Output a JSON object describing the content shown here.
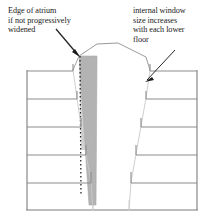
{
  "figure": {
    "type": "architectural-section",
    "background_color": "#ffffff"
  },
  "annotations": {
    "left": {
      "name": "edge-of-atrium-note",
      "text": "Edge of atrium\nif not progressively\nwidened",
      "lines": [
        "Edge of atrium",
        "if not progressively",
        "widened"
      ]
    },
    "right": {
      "name": "internal-window-note",
      "text": "internal window\nsize increases\nwith each lower\nfloor",
      "lines": [
        "internal window",
        "size increases",
        "with each lower",
        "floor"
      ]
    }
  },
  "colors": {
    "wedge_fill": "#b3b3b3",
    "wedge_stroke": "#9a9a9a",
    "line": "#8c8c8c",
    "outline": "#7d7d7d",
    "dotted": "#1f1f1f",
    "leader": "#262626",
    "text": "#1a1a1a"
  },
  "geometry": {
    "left_wall_x": 27,
    "right_wall_x": 197,
    "baseline_y": 210,
    "floor_count": 5,
    "floor_ys": [
      71,
      99,
      127,
      155,
      183
    ],
    "left_opening_x": [
      73,
      77,
      81,
      86,
      91
    ],
    "right_opening_x": [
      150,
      146,
      141,
      136,
      131
    ],
    "atrium_left_top_x": 78,
    "atrium_left_bottom_x": 96,
    "atrium_right_top_x": 145,
    "atrium_right_bottom_x": 127,
    "roof_peak_x": 118,
    "roof_peak_y": 43,
    "wedge_apex_x": 79,
    "wedge_apex_y": 56,
    "wedge_tip_x": 96,
    "wedge_tip_y": 205,
    "dotted_line_x": 80
  }
}
